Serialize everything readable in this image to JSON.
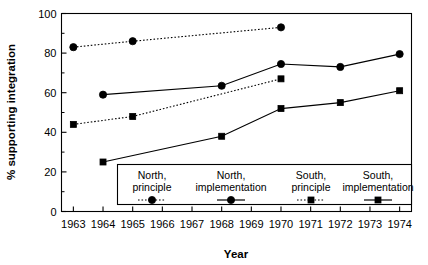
{
  "chart_data": {
    "type": "line",
    "title": "",
    "xlabel": "Year",
    "ylabel": "% supporting integration",
    "xlim": [
      1962.6,
      1974.4
    ],
    "ylim": [
      0,
      100
    ],
    "xticks": [
      1963,
      1964,
      1965,
      1966,
      1967,
      1968,
      1969,
      1970,
      1971,
      1972,
      1973,
      1974
    ],
    "xtick_labels": [
      "1963",
      "1964",
      "1965",
      "1966",
      "1967",
      "1968",
      "1969",
      "1970",
      "1971",
      "1972",
      "1973",
      "1974"
    ],
    "yticks": [
      0,
      20,
      40,
      60,
      80,
      100
    ],
    "ytick_labels": [
      "0",
      "20",
      "40",
      "60",
      "80",
      "100"
    ],
    "yminor_ticks": [
      10,
      30,
      50,
      70,
      90
    ],
    "grid": false,
    "legend_position": "bottom-inside",
    "series": [
      {
        "name": "North, principle",
        "linestyle": "dotted",
        "marker": "circle",
        "color": "#000000",
        "x": [
          1963,
          1965,
          1970
        ],
        "values": [
          83,
          86,
          93
        ]
      },
      {
        "name": "North, implementation",
        "linestyle": "solid",
        "marker": "circle",
        "color": "#000000",
        "x": [
          1964,
          1968,
          1970,
          1972,
          1974
        ],
        "values": [
          59,
          63.5,
          74.5,
          73,
          79.5
        ]
      },
      {
        "name": "South, principle",
        "linestyle": "dotted",
        "marker": "square",
        "color": "#000000",
        "x": [
          1963,
          1965,
          1970
        ],
        "values": [
          44,
          48,
          67
        ]
      },
      {
        "name": "South, implementation",
        "linestyle": "solid",
        "marker": "square",
        "color": "#000000",
        "x": [
          1964,
          1968,
          1970,
          1972,
          1974
        ],
        "values": [
          25,
          38,
          52,
          55,
          61
        ]
      }
    ]
  },
  "legend": {
    "entries": [
      {
        "line1": "North,",
        "line2": "principle",
        "style": "dotted",
        "marker": "circle"
      },
      {
        "line1": "North,",
        "line2": "implementation",
        "style": "solid",
        "marker": "circle"
      },
      {
        "line1": "South,",
        "line2": "principle",
        "style": "dotted",
        "marker": "square"
      },
      {
        "line1": "South,",
        "line2": "implementation",
        "style": "solid",
        "marker": "square"
      }
    ]
  },
  "axes": {
    "x_title": "Year",
    "y_title": "% supporting integration"
  }
}
